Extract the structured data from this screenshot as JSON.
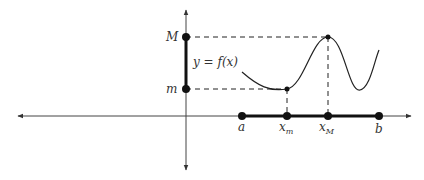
{
  "diagram": {
    "function_label": "y = f(x)",
    "y_labels": {
      "max": "M",
      "min": "m"
    },
    "x_labels": {
      "a": "a",
      "x_min": "x",
      "x_min_sub": "m",
      "x_max": "x",
      "x_max_sub": "M",
      "b": "b"
    },
    "colors": {
      "stroke": "#222222",
      "text": "#333333",
      "background": "#ffffff"
    }
  }
}
